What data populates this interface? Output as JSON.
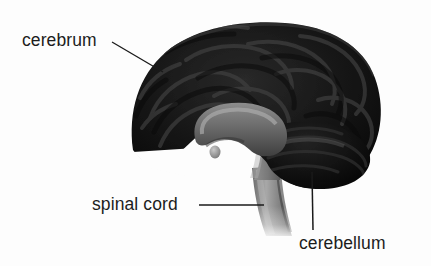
{
  "figure": {
    "background_color": "#fdfdfd",
    "line_color": "#1a1a1a",
    "text_color": "#1c1c1c",
    "width": 431,
    "height": 266
  },
  "labels": {
    "cerebrum": "cerebrum",
    "spinal_cord": "spinal cord",
    "cerebellum": "cerebellum"
  },
  "leader_lines": [
    {
      "name": "cerebrum-leader",
      "x1": 112,
      "y1": 42,
      "x2": 163,
      "y2": 72
    },
    {
      "name": "spinal-cord-leader",
      "x1": 199,
      "y1": 205,
      "x2": 264,
      "y2": 205
    },
    {
      "name": "cerebellum-leader",
      "x1": 312,
      "y1": 172,
      "x2": 313,
      "y2": 230
    }
  ],
  "structures": [
    {
      "name": "cerebrum",
      "fill": "#151515",
      "description": "large folded cortical mass occupying the upper portion"
    },
    {
      "name": "cerebellum",
      "fill": "#0d0d0d",
      "description": "rounded lobed mass at lower right beneath the cerebrum"
    },
    {
      "name": "corpus-callosum",
      "fill": "#6e6e6e",
      "description": "light grey arched band in the brain centre"
    },
    {
      "name": "brainstem",
      "fill": "#7a7a7a",
      "description": "light grey column descending from the brain centre"
    },
    {
      "name": "spinal-cord",
      "fill": "#8a8a8a",
      "description": "grey cord continuing downward from the brainstem, fading at the bottom"
    },
    {
      "name": "pituitary-gland",
      "fill": "#9a9a9a",
      "description": "small rounded nub below the brain centre"
    }
  ]
}
